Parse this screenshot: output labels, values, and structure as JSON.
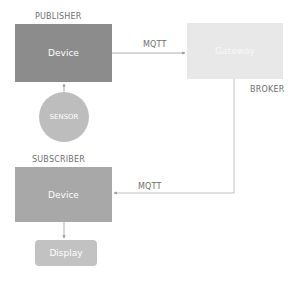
{
  "diagram": {
    "publisher": {
      "section_label": "PUBLISHER",
      "device_label": "Device",
      "color": "#8c8c8c"
    },
    "sensor": {
      "label": "SENSOR",
      "color": "#bdbdbd"
    },
    "gateway": {
      "label": "Gateway",
      "role_label": "BROKER",
      "color": "#e8e8e8"
    },
    "subscriber": {
      "section_label": "SUBSCRIBER",
      "device_label": "Device",
      "color": "#a8a8a8"
    },
    "display": {
      "label": "Display",
      "color": "#c2c2c2"
    },
    "edges": [
      {
        "from": "Sensor",
        "to": "Publisher Device",
        "label": ""
      },
      {
        "from": "Publisher Device",
        "to": "Gateway",
        "label": "MQTT"
      },
      {
        "from": "Gateway",
        "to": "Subscriber Device",
        "label": "MQTT"
      },
      {
        "from": "Subscriber Device",
        "to": "Display",
        "label": ""
      }
    ]
  }
}
